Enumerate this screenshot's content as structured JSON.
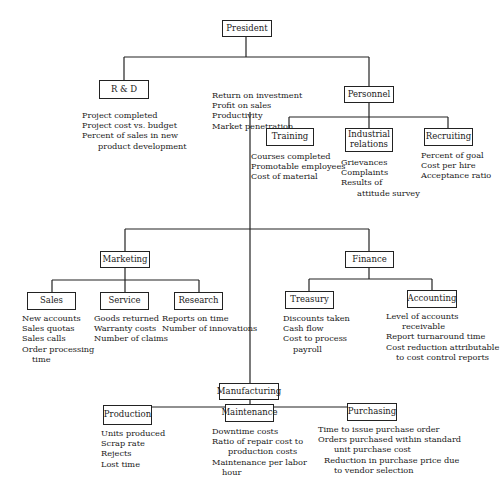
{
  "diagram": {
    "type": "organization-chart",
    "nodes": {
      "president": {
        "label": "President",
        "metrics": [
          "Return on investment",
          "Profit on sales",
          "Productivity",
          "Market penetration"
        ]
      },
      "rnd": {
        "label": "R & D",
        "metrics": [
          "Project completed",
          "Project cost vs. budget",
          "Percent of sales in new",
          "product development"
        ]
      },
      "personnel": {
        "label": "Personnel"
      },
      "training": {
        "label": "Training",
        "metrics": [
          "Courses completed",
          "Promotable employees",
          "Cost of material"
        ]
      },
      "industrial": {
        "label_line1": "Industrial",
        "label_line2": "relations",
        "metrics": [
          "Grievances",
          "Complaints",
          "Results of",
          "attitude survey"
        ]
      },
      "recruiting": {
        "label": "Recruiting",
        "metrics": [
          "Percent of goal",
          "Cost per hire",
          "Acceptance ratio"
        ]
      },
      "marketing": {
        "label": "Marketing"
      },
      "sales": {
        "label": "Sales",
        "metrics": [
          "New accounts",
          "Sales quotas",
          "Sales calls",
          "Order processing",
          "time"
        ]
      },
      "service": {
        "label": "Service",
        "metrics": [
          "Goods returned",
          "Warranty costs",
          "Number of claims"
        ]
      },
      "research": {
        "label": "Research",
        "metrics": [
          "Reports on time",
          "Number of innovations"
        ]
      },
      "finance": {
        "label": "Finance"
      },
      "treasury": {
        "label": "Treasury",
        "metrics": [
          "Discounts taken",
          "Cash flow",
          "Cost to process",
          "payroll"
        ]
      },
      "accounting": {
        "label": "Accounting",
        "metrics": [
          "Level of accounts",
          "receivable",
          "Report turnaround time",
          "Cost reduction attributable",
          "to cost control reports"
        ]
      },
      "manufacturing": {
        "label": "Manufacturing"
      },
      "production": {
        "label": "Production",
        "metrics": [
          "Units produced",
          "Scrap rate",
          "Rejects",
          "Lost time"
        ]
      },
      "maintenance": {
        "label": "Maintenance",
        "metrics": [
          "Downtime costs",
          "Ratio of repair cost to",
          "production costs",
          "Maintenance per labor",
          "hour"
        ]
      },
      "purchasing": {
        "label": "Purchasing",
        "metrics": [
          "Time to issue purchase order",
          "Orders purchased within standard",
          "unit purchase cost",
          "Reduction in purchase price due",
          "to vendor selection"
        ]
      }
    }
  }
}
